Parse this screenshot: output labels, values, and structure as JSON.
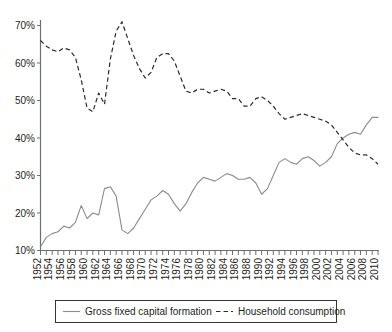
{
  "chart_data": {
    "type": "line",
    "title": "",
    "subtitle": "",
    "xlabel": "",
    "ylabel": "",
    "grid": false,
    "legend_position": "bottom",
    "ylim": [
      10,
      70
    ],
    "xlim": [
      1952,
      2010
    ],
    "ytick_labels": [
      "70%",
      "60%",
      "50%",
      "40%",
      "30%",
      "20%",
      "10%"
    ],
    "ytick_values": [
      70,
      60,
      50,
      40,
      30,
      20,
      10
    ],
    "x": [
      1952,
      1953,
      1954,
      1955,
      1956,
      1957,
      1958,
      1959,
      1960,
      1961,
      1962,
      1963,
      1964,
      1965,
      1966,
      1967,
      1968,
      1969,
      1970,
      1971,
      1972,
      1973,
      1974,
      1975,
      1976,
      1977,
      1978,
      1979,
      1980,
      1981,
      1982,
      1983,
      1984,
      1985,
      1986,
      1987,
      1988,
      1989,
      1990,
      1991,
      1992,
      1993,
      1994,
      1995,
      1996,
      1997,
      1998,
      1999,
      2000,
      2001,
      2002,
      2003,
      2004,
      2005,
      2006,
      2007,
      2008,
      2009,
      2010
    ],
    "xtick_labels": [
      "1952",
      "1954",
      "1956",
      "1958",
      "1960",
      "1962",
      "1964",
      "1966",
      "1968",
      "1970",
      "1972",
      "1974",
      "1976",
      "1978",
      "1980",
      "1982",
      "1984",
      "1986",
      "1988",
      "1990",
      "1992",
      "1994",
      "1996",
      "1998",
      "2000",
      "2002",
      "2004",
      "2006",
      "2008",
      "2010"
    ],
    "series": [
      {
        "name": "Gross fixed capital formation",
        "style": "solid",
        "color": "#8c8c8c",
        "values": [
          11.0,
          13.5,
          14.5,
          15.0,
          16.5,
          16.0,
          17.5,
          22.0,
          18.5,
          20.0,
          19.5,
          26.5,
          27.0,
          24.5,
          15.5,
          14.5,
          16.0,
          18.5,
          21.0,
          23.5,
          24.5,
          26.0,
          25.0,
          22.5,
          20.5,
          22.5,
          25.5,
          28.0,
          29.5,
          29.0,
          28.5,
          29.5,
          30.5,
          30.0,
          29.0,
          29.0,
          29.5,
          28.0,
          25.0,
          26.5,
          30.0,
          33.5,
          34.5,
          33.5,
          33.0,
          34.5,
          35.0,
          34.0,
          32.5,
          33.5,
          35.0,
          38.5,
          40.0,
          41.0,
          41.5,
          41.0,
          43.5,
          45.5,
          45.5
        ]
      },
      {
        "name": "Household consumption",
        "style": "dashed",
        "color": "#2b2b2b",
        "values": [
          66.0,
          64.5,
          63.5,
          63.0,
          64.0,
          63.5,
          61.5,
          55.5,
          48.0,
          47.0,
          52.0,
          49.0,
          61.0,
          68.5,
          71.0,
          66.5,
          62.0,
          58.5,
          56.0,
          57.5,
          61.5,
          62.5,
          62.5,
          60.5,
          56.5,
          52.5,
          52.0,
          53.0,
          53.0,
          52.0,
          52.5,
          53.0,
          52.5,
          50.5,
          50.5,
          48.5,
          48.5,
          50.5,
          51.0,
          50.0,
          48.5,
          46.5,
          45.0,
          45.5,
          46.0,
          46.5,
          46.0,
          45.5,
          45.0,
          44.5,
          43.5,
          41.5,
          39.5,
          37.5,
          36.0,
          35.5,
          35.5,
          34.5,
          33.0
        ]
      }
    ]
  },
  "legend": {
    "entries": [
      {
        "label": "Gross fixed capital formation",
        "style": "solid"
      },
      {
        "label": "Household consumption",
        "style": "dashed"
      }
    ]
  }
}
